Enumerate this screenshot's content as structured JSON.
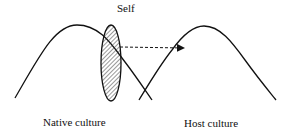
{
  "diagram": {
    "labels": {
      "self": "Self",
      "native": "Native culture",
      "host": "Host culture"
    },
    "colors": {
      "stroke": "#111111",
      "background": "#ffffff"
    },
    "elements": {
      "native_curve": "bell curve representing native culture",
      "host_curve": "bell curve representing host culture",
      "self_ellipse": "hatched ellipse representing the self, positioned on native curve",
      "arrow": "dashed arrow from self toward host culture curve"
    }
  }
}
